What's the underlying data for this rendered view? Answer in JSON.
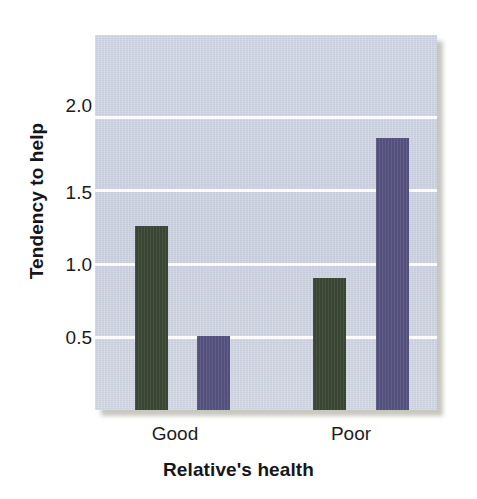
{
  "chart_data": {
    "type": "bar",
    "title": "",
    "xlabel": "Relative's health",
    "ylabel": "Tendency to help",
    "categories": [
      "Good",
      "Poor"
    ],
    "series": [
      {
        "name": "series-1",
        "color": "#3d4a36",
        "values": [
          1.25,
          0.9
        ]
      },
      {
        "name": "series-2",
        "color": "#585683",
        "values": [
          0.5,
          1.85
        ]
      }
    ],
    "yticks": [
      0.5,
      1.0,
      1.5,
      2.0
    ],
    "ytick_labels": [
      "0.5",
      "1.0",
      "1.5",
      "2.0"
    ],
    "ylim": [
      0,
      2.55
    ],
    "grid": "horizontal",
    "legend": "none",
    "plot_background": "#ccd2e1",
    "gridline_color": "#fbfbfd"
  },
  "axis": {
    "y_title": "Tendency to help",
    "x_title": "Relative's health",
    "ytick_0": "0.5",
    "ytick_1": "1.0",
    "ytick_2": "1.5",
    "ytick_3": "2.0",
    "xtick_0": "Good",
    "xtick_1": "Poor"
  }
}
